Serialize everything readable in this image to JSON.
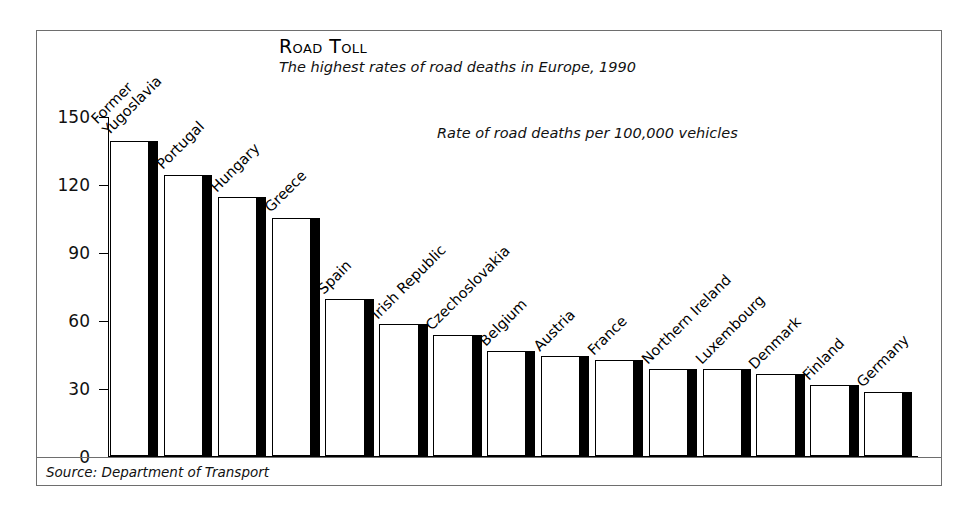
{
  "chart_data": {
    "type": "bar",
    "title": "Road Toll",
    "subtitle": "The highest rates of road deaths in Europe, 1990",
    "annotation": "Rate of road deaths per 100,000 vehicles",
    "source": "Source: Department of Transport",
    "xlabel": "",
    "ylabel": "",
    "ylim": [
      0,
      150
    ],
    "ytick_values": [
      150,
      120,
      90,
      60,
      30,
      0
    ],
    "ytick_labels": [
      "150",
      "120",
      "90",
      "60",
      "30",
      "0"
    ],
    "grid": false,
    "legend": "none",
    "categories": [
      "Former Yugoslavia",
      "Portugal",
      "Hungary",
      "Greece",
      "Spain",
      "Irish Republic",
      "Czechoslovakia",
      "Belgium",
      "Austria",
      "France",
      "Northern Ireland",
      "Luxembourg",
      "Denmark",
      "Finland",
      "Germany"
    ],
    "category_lines": [
      [
        "Former",
        "Yugoslavia"
      ],
      [
        "Portugal"
      ],
      [
        "Hungary"
      ],
      [
        "Greece"
      ],
      [
        "Spain"
      ],
      [
        "Irish Republic"
      ],
      [
        "Czechoslovakia"
      ],
      [
        "Belgium"
      ],
      [
        "Austria"
      ],
      [
        "France"
      ],
      [
        "Northern Ireland"
      ],
      [
        "Luxembourg"
      ],
      [
        "Denmark"
      ],
      [
        "Finland"
      ],
      [
        "Germany"
      ]
    ],
    "values": [
      139,
      124,
      114,
      105,
      69,
      58,
      53,
      46,
      44,
      42,
      38,
      38,
      36,
      31,
      28
    ],
    "colors": {
      "bar_fill": "#ffffff",
      "bar_outline": "#000000",
      "bar_shade": "#000000",
      "axis": "#000000",
      "frame": "#6e6e6e",
      "text": "#111111"
    }
  }
}
